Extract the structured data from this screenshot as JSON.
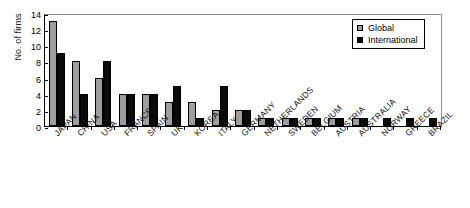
{
  "chart_data": {
    "type": "bar",
    "title": "",
    "xlabel": "",
    "ylabel": "No. of firms",
    "ylim": [
      0,
      14
    ],
    "yticks": [
      0,
      2,
      4,
      6,
      8,
      10,
      12,
      14
    ],
    "grid": false,
    "legend_position": "top-right",
    "categories": [
      "JAPAN",
      "CHINA",
      "USA",
      "FRANCE",
      "SPAIN",
      "UK",
      "KOREA",
      "ITALY",
      "GERMANY",
      "NETHERLANDS",
      "SWEDEN",
      "BELGIUM",
      "AUSTRIA",
      "AUSTRALIA",
      "NORWAY",
      "GREECE",
      "BRAZIL"
    ],
    "series": [
      {
        "name": "Global",
        "color": "#9e9e9e",
        "values": [
          13,
          8,
          6,
          4,
          4,
          3,
          3,
          2,
          2,
          1,
          1,
          1,
          1,
          1,
          0,
          0,
          0
        ]
      },
      {
        "name": "International",
        "color": "#0a0a0a",
        "values": [
          9,
          4,
          8,
          4,
          4,
          5,
          1,
          5,
          2,
          1,
          1,
          1,
          1,
          1,
          1,
          1,
          1
        ]
      }
    ]
  },
  "legend": {
    "items": [
      {
        "label": "Global"
      },
      {
        "label": "International"
      }
    ]
  }
}
